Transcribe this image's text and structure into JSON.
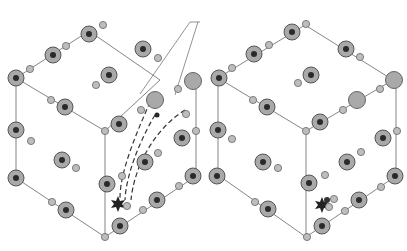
{
  "figure": {
    "panels": [
      {
        "id": "left",
        "label": "",
        "has_migration_paths": true,
        "has_callout_lines": true
      },
      {
        "id": "right",
        "label": "",
        "has_migration_paths": false,
        "has_callout_lines": false
      }
    ],
    "colors": {
      "large_atom_fill": "#a9a9a9",
      "large_atom_stroke": "#555555",
      "core_fill": "#2a2a2a",
      "small_atom_fill": "#bdbdbd",
      "edge_line": "#777777",
      "defect": "#222222"
    },
    "icons": [
      "large-atom",
      "small-atom",
      "star-defect",
      "dashed-arrow"
    ]
  }
}
